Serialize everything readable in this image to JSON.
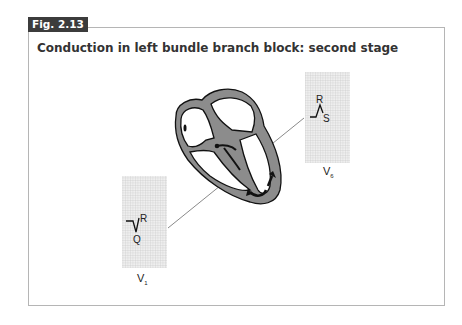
{
  "figure": {
    "number": "Fig. 2.13",
    "title": "Conduction in left bundle branch block: second stage"
  },
  "leads": [
    {
      "name": "V",
      "sub": "6",
      "waves": {
        "upper": "R",
        "lower": "S"
      }
    },
    {
      "name": "V",
      "sub": "1",
      "waves": {
        "upper": "R",
        "lower": "Q"
      }
    }
  ],
  "colors": {
    "tab_bg": "#3c3c3c",
    "myocardium": "#8c8c8c",
    "grid": "#c8c8c8",
    "frame": "#b5b5b5"
  }
}
